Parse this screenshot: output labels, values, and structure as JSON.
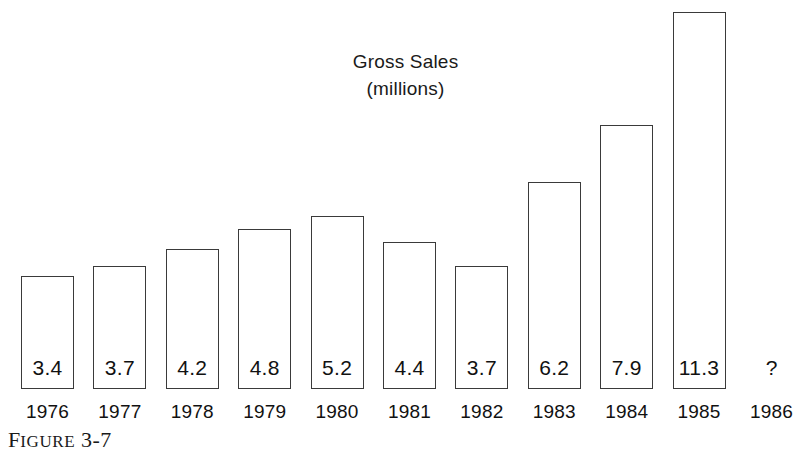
{
  "chart_data": {
    "type": "bar",
    "title": "Gross Sales",
    "subtitle": "(millions)",
    "xlabel": "",
    "ylabel": "",
    "ylim": [
      0,
      11.3
    ],
    "grid": false,
    "legend": null,
    "categories": [
      "1976",
      "1977",
      "1978",
      "1979",
      "1980",
      "1981",
      "1982",
      "1983",
      "1984",
      "1985",
      "1986"
    ],
    "values": [
      3.4,
      3.7,
      4.2,
      4.8,
      5.2,
      4.4,
      3.7,
      6.2,
      7.9,
      11.3,
      null
    ],
    "value_labels": [
      "3.4",
      "3.7",
      "4.2",
      "4.8",
      "5.2",
      "4.4",
      "3.7",
      "6.2",
      "7.9",
      "11.3",
      "?"
    ],
    "bars": [
      {
        "year": "1976",
        "value": 3.4,
        "label": "3.4"
      },
      {
        "year": "1977",
        "value": 3.7,
        "label": "3.7"
      },
      {
        "year": "1978",
        "value": 4.2,
        "label": "4.2"
      },
      {
        "year": "1979",
        "value": 4.8,
        "label": "4.8"
      },
      {
        "year": "1980",
        "value": 5.2,
        "label": "5.2"
      },
      {
        "year": "1981",
        "value": 4.4,
        "label": "4.4"
      },
      {
        "year": "1982",
        "value": 3.7,
        "label": "3.7"
      },
      {
        "year": "1983",
        "value": 6.2,
        "label": "6.2"
      },
      {
        "year": "1984",
        "value": 7.9,
        "label": "7.9"
      },
      {
        "year": "1985",
        "value": 11.3,
        "label": "11.3"
      },
      {
        "year": "1986",
        "value": null,
        "label": "?"
      }
    ],
    "annotations": [
      "? marks the unknown 1986 value (no bar drawn)"
    ],
    "colors": {
      "bar_fill": "#ffffff",
      "bar_outline": "#3a3a3a",
      "text": "#111111",
      "background": "#ffffff"
    }
  },
  "caption": {
    "lead": "F",
    "rest": "IGURE",
    "number": "3-7"
  }
}
